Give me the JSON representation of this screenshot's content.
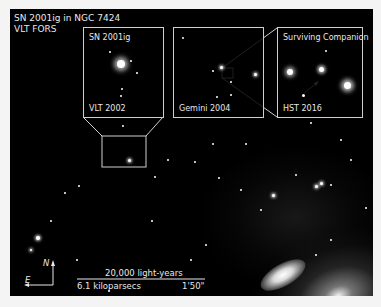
{
  "title": {
    "line1": "SN 2001ig in NGC 7424",
    "line2": "VLT FORS"
  },
  "insets": [
    {
      "top_label": "SN 2001ig",
      "bottom_label": "VLT 2002"
    },
    {
      "top_label": "",
      "bottom_label": "Gemini 2004"
    },
    {
      "top_label": "Surviving Companion",
      "bottom_label": "HST 2016"
    }
  ],
  "compass": {
    "north": "N",
    "east": "E"
  },
  "scale_bar": {
    "top_label": "20,000 light-years",
    "left_label": "6.1 kiloparsecs",
    "right_label": "1'50\""
  },
  "colors": {
    "background": "#000000",
    "border": "#f4f4f4",
    "text": "#e8e8e8",
    "lines": "#cfcfcf"
  }
}
